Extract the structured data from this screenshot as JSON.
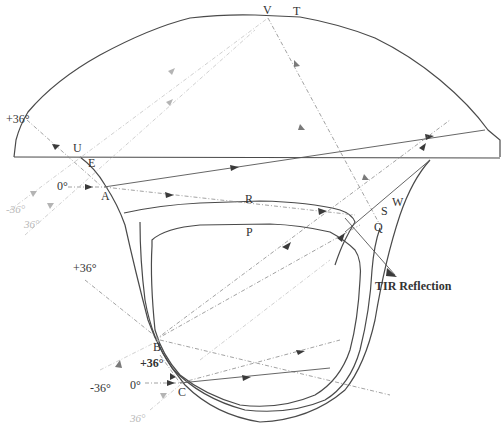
{
  "figure": {
    "type": "optical ray-trace diagram"
  },
  "points": {
    "A": "A",
    "B": "B",
    "C": "C",
    "E": "E",
    "P": "P",
    "Q": "Q",
    "R": "R",
    "S": "S",
    "T": "T",
    "U": "U",
    "V": "V",
    "W": "W"
  },
  "angle_labels": {
    "top_left_plus36": "+36°",
    "a_zero": "0°",
    "a_minus36_upper": "-36°",
    "a_minus36_lower": "36°",
    "b_plus36": "+36°",
    "c_plus36": "+36°",
    "c_zero": "0°",
    "c_minus36": "-36°",
    "c_minus36_lower": "36°"
  },
  "annotations": {
    "tir": "TIR Reflection"
  },
  "colors": {
    "outline": "#4a4a4a",
    "ray_solid": "#555555",
    "ray_dashed": "#8a8a8a",
    "ray_faint": "#c4c4c4",
    "background": "#ffffff"
  }
}
